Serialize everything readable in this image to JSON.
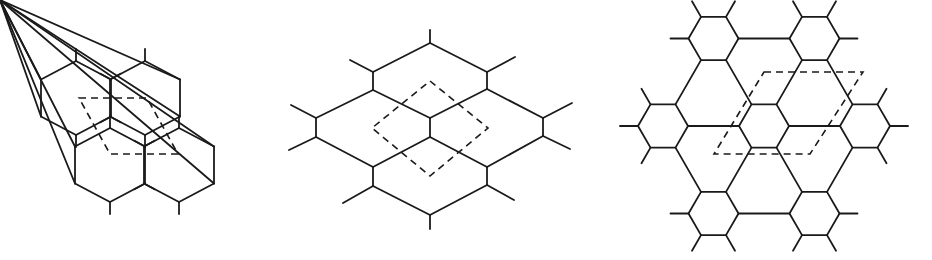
{
  "figure": {
    "panels": [
      {
        "id": "honeycomb",
        "description": "Honeycomb lattice with dashed rhombic unit cell"
      },
      {
        "id": "rhombic",
        "description": "Stretched hexagonal lattice with dashed square-like unit cell"
      },
      {
        "id": "star",
        "description": "Star lattice of small hexagons linked by bonds with dashed rhombic unit cell"
      }
    ],
    "colors": {
      "line": "#1a1a1a",
      "background": "#ffffff"
    }
  }
}
